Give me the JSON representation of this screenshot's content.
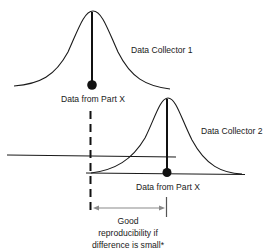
{
  "diagram": {
    "collector1": {
      "label": "Data Collector 1",
      "point_label": "Data from Part X"
    },
    "collector2": {
      "label": "Data Collector 2",
      "point_label": "Data from Part X"
    },
    "annotation": {
      "lines": [
        "Good",
        "reproducibility if",
        "difference is small*"
      ]
    },
    "colors": {
      "ink": "#1a1a1a",
      "arrow": "#8a8a8a",
      "background": "#ffffff"
    }
  }
}
